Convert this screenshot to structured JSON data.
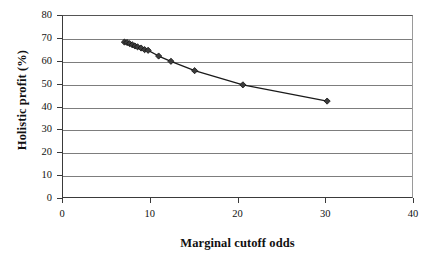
{
  "chart_data": {
    "type": "line",
    "title": "",
    "xlabel": "Marginal cutoff odds",
    "ylabel": "Holistic profit (%)",
    "xlim": [
      0,
      40
    ],
    "ylim": [
      0,
      80
    ],
    "xticks": [
      0,
      10,
      20,
      30,
      40
    ],
    "yticks": [
      0,
      10,
      20,
      30,
      40,
      50,
      60,
      70,
      80
    ],
    "xtick_labels": [
      "0",
      "10",
      "20",
      "30",
      "40"
    ],
    "ytick_labels": [
      "0",
      "10",
      "20",
      "30",
      "40",
      "50",
      "60",
      "70",
      "80"
    ],
    "grid": "horizontal",
    "legend": "none",
    "marker": "diamond",
    "marker_color": "#3c3c3c",
    "line_color": "#1a1a1a",
    "series": [
      {
        "name": "Holistic profit",
        "points": [
          {
            "x": 7.0,
            "y": 68.6
          },
          {
            "x": 7.3,
            "y": 68.4
          },
          {
            "x": 7.6,
            "y": 67.9
          },
          {
            "x": 7.9,
            "y": 67.4
          },
          {
            "x": 8.2,
            "y": 66.9
          },
          {
            "x": 8.5,
            "y": 66.5
          },
          {
            "x": 8.9,
            "y": 66.0
          },
          {
            "x": 9.3,
            "y": 65.3
          },
          {
            "x": 9.7,
            "y": 65.0
          },
          {
            "x": 10.9,
            "y": 62.5
          },
          {
            "x": 12.3,
            "y": 60.2
          },
          {
            "x": 15.0,
            "y": 56.1
          },
          {
            "x": 20.5,
            "y": 49.9
          },
          {
            "x": 30.1,
            "y": 42.8
          }
        ]
      }
    ]
  },
  "axes": {
    "x_title": "Marginal cutoff odds",
    "y_title": "Holistic profit (%)"
  },
  "colors": {
    "background": "#ffffff",
    "gridline": "#7d7d7d",
    "axis": "#3a3a3a",
    "marker": "#3c3c3c",
    "line": "#1a1a1a",
    "text": "#111111"
  }
}
